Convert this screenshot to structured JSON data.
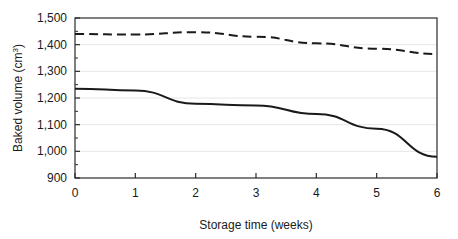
{
  "chart_data": {
    "type": "line",
    "title": "",
    "xlabel": "Storage time (weeks)",
    "ylabel": "Baked volume (cm",
    "ylabel_sup": "3",
    "ylabel_suffix": ")",
    "xlim": [
      0,
      6
    ],
    "ylim": [
      900,
      1500
    ],
    "x": [
      0,
      1,
      2,
      3,
      4,
      5,
      6
    ],
    "xticks": [
      0,
      1,
      2,
      3,
      4,
      5,
      6
    ],
    "xtick_labels": [
      "0",
      "1",
      "2",
      "3",
      "4",
      "5",
      "6"
    ],
    "yticks": [
      900,
      1000,
      1100,
      1200,
      1300,
      1400,
      1500
    ],
    "ytick_labels": [
      "900",
      "1,000",
      "1,100",
      "1,200",
      "1,300",
      "1,400",
      "1,500"
    ],
    "yminor_ticks": [
      950,
      1050,
      1150,
      1250,
      1350,
      1450
    ],
    "grid": "horizontal",
    "legend": "none",
    "series": [
      {
        "name": "dashed-series",
        "style": "dashed",
        "color": "#1a1a1a",
        "values": [
          1440,
          1438,
          1447,
          1430,
          1405,
          1385,
          1365
        ]
      },
      {
        "name": "solid-series",
        "style": "solid",
        "color": "#1a1a1a",
        "values": [
          1235,
          1228,
          1178,
          1172,
          1140,
          1085,
          980
        ]
      }
    ]
  },
  "axes": {
    "frame_color": "#2b2b2b",
    "grid_color": "#e6e6e6"
  }
}
